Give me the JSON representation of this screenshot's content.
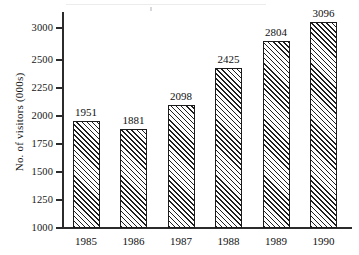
{
  "chart_data": {
    "type": "bar",
    "title": "",
    "xlabel": "",
    "ylabel": "No. of visitors (000s)",
    "categories": [
      "1985",
      "1986",
      "1987",
      "1988",
      "1989",
      "1990"
    ],
    "values": [
      1951,
      1881,
      2098,
      2425,
      2804,
      3096
    ],
    "value_labels": [
      "1951",
      "1881",
      "2098",
      "2425",
      "2804",
      "3096"
    ],
    "series": [
      {
        "name": "No. of visitors (000s)",
        "values": [
          1951,
          1881,
          2098,
          2425,
          2804,
          3096
        ]
      }
    ],
    "ylim": [
      1000,
      3200
    ],
    "ytick_labels": [
      "3000",
      "2500",
      "2250",
      "2000",
      "1750",
      "1500",
      "1250",
      "1000"
    ],
    "ytick_values": [
      3000,
      2500,
      2250,
      2000,
      1750,
      1500,
      1250,
      1000
    ],
    "grid": false,
    "legend": null,
    "legend_position": "none",
    "bar_fill": "diagonal-hatch",
    "colors": {
      "axis": "#2b2b2b",
      "bar_outline": "#1b1b1b",
      "bar_hatch": "#1e1e1e",
      "bar_fill": "#fdfdfd",
      "text": "#101010",
      "background": "#ffffff"
    }
  }
}
